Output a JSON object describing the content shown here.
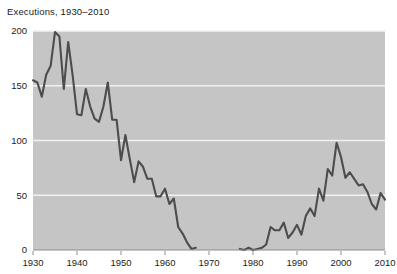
{
  "chart_data": {
    "type": "line",
    "title": "Executions, 1930–2010",
    "xlabel": "",
    "ylabel": "",
    "xlim": [
      1930,
      2010
    ],
    "ylim": [
      0,
      200
    ],
    "grid": true,
    "grid_axis": "y",
    "legend": "none",
    "colors": {
      "plot_background": "#c5c5c5",
      "grid_line": "#f2f2f2",
      "series_line": "#4d4d4d",
      "axis_line": "#8c8c8c",
      "text": "#1c1c1c",
      "figure_background": "#ffffff"
    },
    "yticks": [
      0,
      50,
      100,
      150,
      200
    ],
    "ytick_labels": [
      "0",
      "50",
      "100",
      "150",
      "200"
    ],
    "xticks": [
      1930,
      1940,
      1950,
      1960,
      1970,
      1980,
      1990,
      2000,
      2010
    ],
    "xtick_labels": [
      "1930",
      "1940",
      "1950",
      "1960",
      "1970",
      "1980",
      "1990",
      "2000",
      "2010"
    ],
    "series": [
      {
        "name": "Executions",
        "segments": [
          {
            "name": "pre-moratorium",
            "x": [
              1930,
              1931,
              1932,
              1933,
              1934,
              1935,
              1936,
              1937,
              1938,
              1939,
              1940,
              1941,
              1942,
              1943,
              1944,
              1945,
              1946,
              1947,
              1948,
              1949,
              1950,
              1951,
              1952,
              1953,
              1954,
              1955,
              1956,
              1957,
              1958,
              1959,
              1960,
              1961,
              1962,
              1963,
              1964,
              1965,
              1966,
              1967
            ],
            "y": [
              155,
              153,
              140,
              160,
              168,
              199,
              195,
              147,
              190,
              160,
              124,
              123,
              147,
              131,
              120,
              117,
              131,
              153,
              119,
              119,
              82,
              105,
              83,
              62,
              81,
              76,
              65,
              65,
              49,
              49,
              56,
              42,
              47,
              21,
              15,
              7,
              1,
              2
            ]
          },
          {
            "name": "post-moratorium",
            "x": [
              1977,
              1978,
              1979,
              1980,
              1981,
              1982,
              1983,
              1984,
              1985,
              1986,
              1987,
              1988,
              1989,
              1990,
              1991,
              1992,
              1993,
              1994,
              1995,
              1996,
              1997,
              1998,
              1999,
              2000,
              2001,
              2002,
              2003,
              2004,
              2005,
              2006,
              2007,
              2008,
              2009,
              2010
            ],
            "y": [
              1,
              0,
              2,
              0,
              1,
              2,
              5,
              21,
              18,
              18,
              25,
              11,
              16,
              23,
              14,
              31,
              38,
              31,
              56,
              45,
              74,
              68,
              98,
              85,
              66,
              71,
              65,
              59,
              60,
              53,
              42,
              37,
              52,
              46
            ]
          }
        ]
      }
    ]
  }
}
